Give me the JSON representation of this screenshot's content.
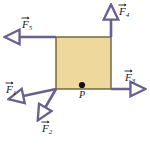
{
  "figure": {
    "background_color": "#ffffff",
    "block": {
      "name": "square-block",
      "fill_color": "#efd89b",
      "stroke_color": "#6b6136",
      "x": 56,
      "y": 37,
      "width": 55,
      "height": 52
    },
    "point": {
      "label": "P",
      "dot_color": "#111111",
      "x": 82,
      "y": 85
    },
    "vector_color": "#6b5f8f",
    "arrowhead_fill": "#ffffff",
    "vectors": [
      {
        "id": "F1",
        "label_base": "F",
        "label_sub": "1",
        "origin_x": 56,
        "origin_y": 89,
        "tip_x": 9,
        "tip_y": 99,
        "label_x": 6,
        "label_y": 84
      },
      {
        "id": "F2",
        "label_base": "F",
        "label_sub": "2",
        "origin_x": 56,
        "origin_y": 89,
        "tip_x": 38,
        "tip_y": 120,
        "label_x": 42,
        "label_y": 123
      },
      {
        "id": "F3",
        "label_base": "F",
        "label_sub": "3",
        "origin_x": 111,
        "origin_y": 89,
        "tip_x": 145,
        "tip_y": 89,
        "label_x": 125,
        "label_y": 72
      },
      {
        "id": "F4",
        "label_base": "F",
        "label_sub": "4",
        "origin_x": 111,
        "origin_y": 37,
        "tip_x": 111,
        "tip_y": 5,
        "label_x": 119,
        "label_y": 6
      },
      {
        "id": "F5",
        "label_base": "F",
        "label_sub": "5",
        "origin_x": 56,
        "origin_y": 37,
        "tip_x": 5,
        "tip_y": 37,
        "label_x": 22,
        "label_y": 19
      }
    ]
  }
}
